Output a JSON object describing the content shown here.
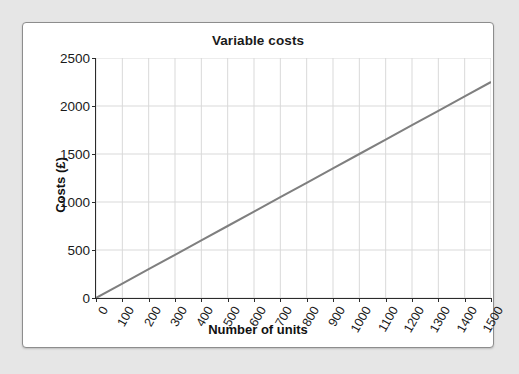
{
  "chart_data": {
    "type": "line",
    "title": "Variable costs",
    "xlabel": "Number of units",
    "ylabel": "Costs (£)",
    "xlim": [
      0,
      1500
    ],
    "ylim": [
      0,
      2500
    ],
    "grid": true,
    "legend": null,
    "xticks": [
      0,
      100,
      200,
      300,
      400,
      500,
      600,
      700,
      800,
      900,
      1000,
      1100,
      1200,
      1300,
      1400,
      1500
    ],
    "xtick_labels": [
      "0",
      "100",
      "200",
      "300",
      "400",
      "500",
      "600",
      "700",
      "800",
      "900",
      "1000",
      "1100",
      "1200",
      "1300",
      "1400",
      "1500"
    ],
    "yticks": [
      0,
      500,
      1000,
      1500,
      2000,
      2500
    ],
    "ytick_labels": [
      "0",
      "500",
      "1000",
      "1500",
      "2000",
      "2500"
    ],
    "series": [
      {
        "name": "Variable costs",
        "color": "#7f7f7f",
        "x": [
          0,
          100,
          200,
          300,
          400,
          500,
          600,
          700,
          800,
          900,
          1000,
          1100,
          1200,
          1300,
          1400,
          1500
        ],
        "values": [
          0,
          150,
          300,
          450,
          600,
          750,
          900,
          1050,
          1200,
          1350,
          1500,
          1650,
          1800,
          1950,
          2100,
          2250
        ]
      }
    ]
  },
  "style": {
    "page_background": "#e6e6e6",
    "card_background": "#ffffff",
    "card_border": "#8d8d8d",
    "axis_color": "#2b2b2b",
    "grid_color": "#d9d9d9",
    "text_color": "#1a1a1a"
  }
}
